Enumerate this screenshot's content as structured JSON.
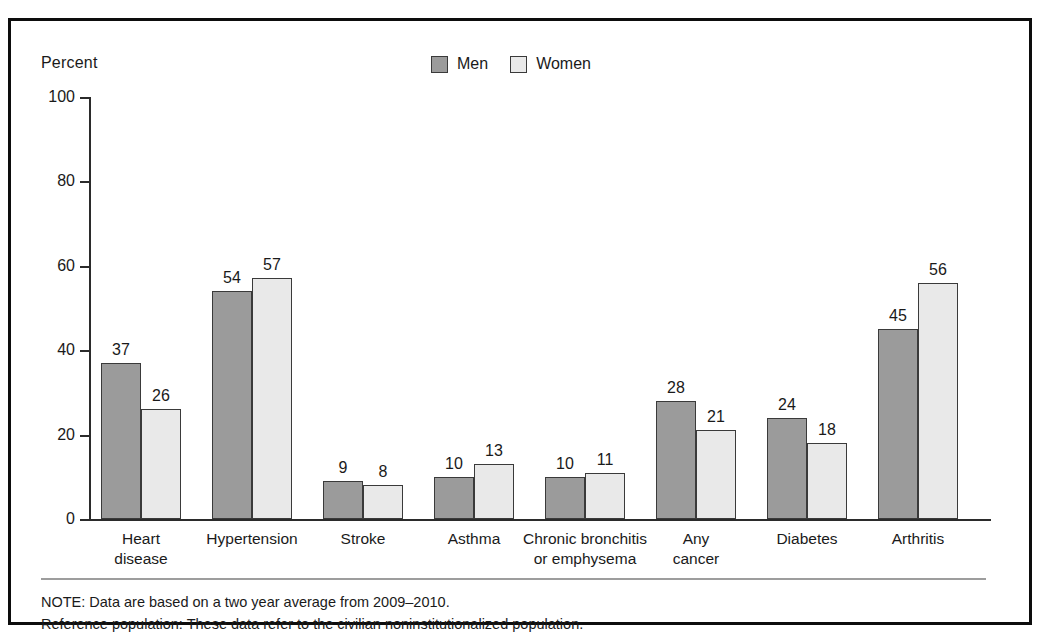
{
  "chart_data": {
    "type": "bar",
    "title": "",
    "xlabel": "",
    "ylabel": "Percent",
    "ylim": [
      0,
      100
    ],
    "yticks": [
      0,
      20,
      40,
      60,
      80,
      100
    ],
    "grid": false,
    "legend_position": "top-center",
    "categories": [
      "Heart disease",
      "Hypertension",
      "Stroke",
      "Asthma",
      "Chronic bronchitis or emphysema",
      "Any cancer",
      "Diabetes",
      "Arthritis"
    ],
    "category_lines": [
      [
        "Heart",
        "disease"
      ],
      [
        "Hypertension"
      ],
      [
        "Stroke"
      ],
      [
        "Asthma"
      ],
      [
        "Chronic bronchitis",
        "or emphysema"
      ],
      [
        "Any",
        "cancer"
      ],
      [
        "Diabetes"
      ],
      [
        "Arthritis"
      ]
    ],
    "series": [
      {
        "name": "Men",
        "color": "#9b9b9b",
        "values": [
          37,
          54,
          9,
          10,
          10,
          28,
          24,
          45
        ]
      },
      {
        "name": "Women",
        "color": "#e9e9e9",
        "values": [
          26,
          57,
          8,
          13,
          11,
          21,
          18,
          56
        ]
      }
    ]
  },
  "legend": {
    "items": [
      {
        "label": "Men",
        "color": "#9b9b9b"
      },
      {
        "label": "Women",
        "color": "#e9e9e9"
      }
    ]
  },
  "axis": {
    "y_title": "Percent",
    "y_ticks": [
      "100",
      "80",
      "60",
      "40",
      "20",
      "0"
    ]
  },
  "notes": {
    "line1": "NOTE: Data are based on a two year average from 2009–2010.",
    "line2": "Reference population: These data refer to the civilian noninstitutionalized population."
  },
  "colors": {
    "men_fill": "#9b9b9b",
    "women_fill": "#e9e9e9",
    "bar_stroke": "#3a3a3a",
    "axis": "#2b2b2b",
    "frame": "#0d0d0d",
    "rule": "#9d9d9d"
  }
}
